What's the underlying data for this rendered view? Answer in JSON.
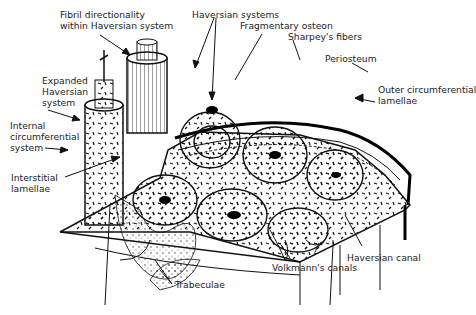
{
  "diagram": {
    "labels": {
      "fibril": [
        "Fibril directionality",
        "within Haversian system"
      ],
      "haversian_systems": "Haversian systems",
      "fragmentary_osteon": "Fragmentary osteon",
      "sharpeys_fibers": "Sharpey's fibers",
      "periosteum": "Periosteum",
      "outer_circumferential": [
        "Outer circumferential",
        "lamellae"
      ],
      "expanded_haversian": [
        "Expanded",
        "Haversian",
        "system"
      ],
      "internal_circumferential": [
        "Internal",
        "circumferential",
        "system"
      ],
      "interstitial": [
        "Interstitial",
        "lamellae"
      ],
      "trabeculae": "Trabeculae",
      "haversian_canal": "Haversian canal",
      "volkmanns_canals": "Volkmann's canals"
    }
  }
}
